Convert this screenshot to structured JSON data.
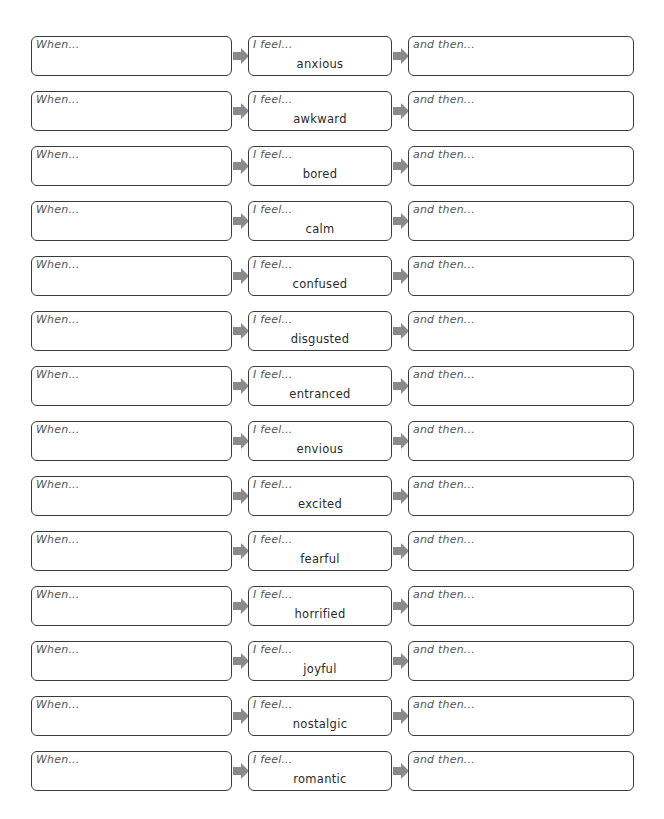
{
  "worksheet": {
    "when_label": "When...",
    "feel_label": "I feel...",
    "then_label": "and then...",
    "arrow_color": "#8a8a8a",
    "border_color": "#3a3a3a",
    "rows": [
      {
        "emotion": "anxious"
      },
      {
        "emotion": "awkward"
      },
      {
        "emotion": "bored"
      },
      {
        "emotion": "calm"
      },
      {
        "emotion": "confused"
      },
      {
        "emotion": "disgusted"
      },
      {
        "emotion": "entranced"
      },
      {
        "emotion": "envious"
      },
      {
        "emotion": "excited"
      },
      {
        "emotion": "fearful"
      },
      {
        "emotion": "horrified"
      },
      {
        "emotion": "joyful"
      },
      {
        "emotion": "nostalgic"
      },
      {
        "emotion": "romantic"
      }
    ]
  }
}
